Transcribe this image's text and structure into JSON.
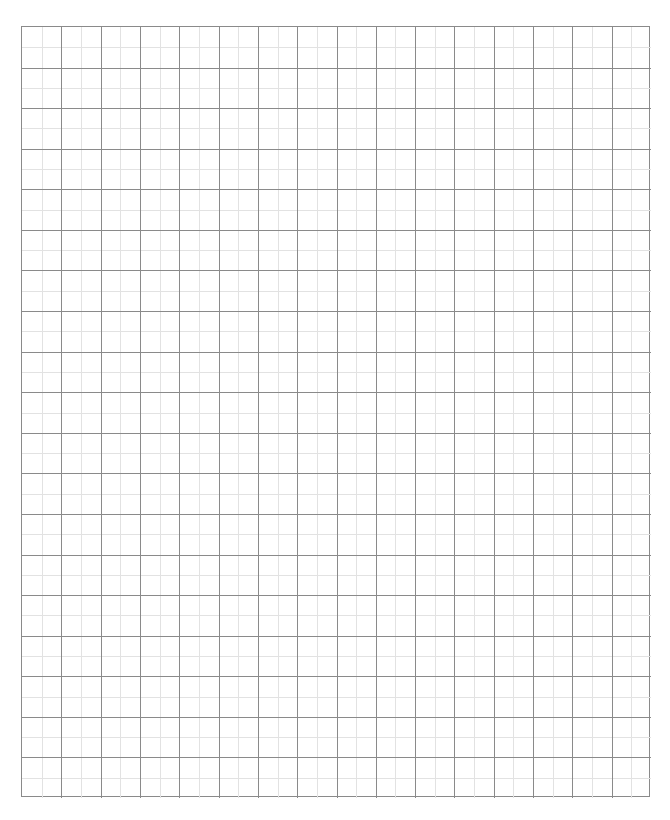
{
  "sheet": {
    "type": "graph-paper",
    "columns": 16,
    "rows": 19,
    "subdivisions": 2,
    "colors": {
      "background": "#ffffff",
      "major_line": "#8a8a8a",
      "minor_line": "#e2e2e2",
      "border": "#8a8a8a"
    }
  }
}
